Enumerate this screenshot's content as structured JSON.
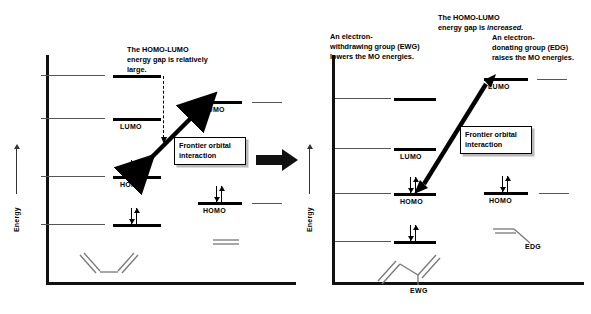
{
  "figure": {
    "type": "frontier-molecular-orbital-diagram"
  },
  "axes": {
    "y_label": "Energy"
  },
  "left_panel": {
    "name": "unsubstituted",
    "annotation": "The HOMO-LUMO\nenergy gap is relatively\nlarge.",
    "callout": "Frontier orbital\ninteraction",
    "diene": {
      "name": "butadiene",
      "levels": [
        {
          "id": "psi4",
          "label": "",
          "electrons": 0,
          "lobes": [
            "dw",
            "wd",
            "dw",
            "wd"
          ]
        },
        {
          "id": "psi3",
          "label": "LUMO",
          "electrons": 0,
          "lobes": [
            "wd",
            "dw",
            "dw",
            "wd"
          ]
        },
        {
          "id": "psi2",
          "label": "HOMO",
          "electrons": 2,
          "lobes": [
            "wd",
            "wd",
            "dw",
            "dw"
          ]
        },
        {
          "id": "psi1",
          "label": "",
          "electrons": 2,
          "lobes": [
            "dw",
            "dw",
            "dw",
            "dw"
          ]
        }
      ]
    },
    "dienophile": {
      "name": "ethylene",
      "levels": [
        {
          "id": "pi-star",
          "label": "LUMO",
          "electrons": 0,
          "lobes": [
            "dw",
            "wd"
          ]
        },
        {
          "id": "pi",
          "label": "HOMO",
          "electrons": 2,
          "lobes": [
            "dw",
            "dw"
          ]
        }
      ]
    }
  },
  "right_panel": {
    "name": "substituted",
    "annotation_ewg": "An electron-\nwithdrawing group (EWG)\nlowers the MO energies.",
    "annotation_edg": "An electron-\ndonating group (EDG)\nraises the MO energies.",
    "annotation_gap_pre": "The HOMO-LUMO\nenergy gap is ",
    "annotation_gap_em": "increased.",
    "callout": "Frontier orbital\ninteraction",
    "diene": {
      "name": "EWG-substituted butadiene",
      "substituent": "EWG",
      "levels": [
        {
          "id": "psi4",
          "label": "",
          "electrons": 0,
          "lobes": [
            "dw",
            "wd",
            "dw",
            "wd"
          ]
        },
        {
          "id": "psi3",
          "label": "LUMO",
          "electrons": 0,
          "lobes": [
            "wd",
            "dw",
            "dw",
            "wd"
          ]
        },
        {
          "id": "psi2",
          "label": "HOMO",
          "electrons": 2,
          "lobes": [
            "wd",
            "wd",
            "dw",
            "dw"
          ]
        },
        {
          "id": "psi1",
          "label": "",
          "electrons": 2,
          "lobes": [
            "dw",
            "dw",
            "dw",
            "dw"
          ]
        }
      ]
    },
    "dienophile": {
      "name": "EDG-substituted ethylene",
      "substituent": "EDG",
      "levels": [
        {
          "id": "pi-star",
          "label": "LUMO",
          "electrons": 0,
          "lobes": [
            "dw",
            "wd"
          ]
        },
        {
          "id": "pi",
          "label": "HOMO",
          "electrons": 2,
          "lobes": [
            "dw",
            "dw"
          ]
        }
      ]
    }
  },
  "colors": {
    "ink": "#000000",
    "lobe_dark": "#3a3a3a",
    "lobe_light": "#ffffff",
    "molecule_line": "#777777",
    "callout_shadow": "#b9b9b9"
  }
}
